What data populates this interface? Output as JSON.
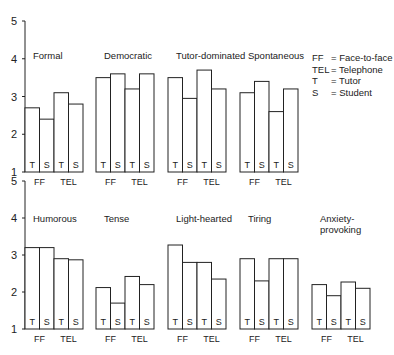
{
  "legend": [
    {
      "abbr": "FF",
      "meaning": "= Face-to-face"
    },
    {
      "abbr": "TEL",
      "meaning": "= Telephone"
    },
    {
      "abbr": "T",
      "meaning": "= Tutor"
    },
    {
      "abbr": "S",
      "meaning": "= Student"
    }
  ],
  "chart_data": {
    "type": "bar",
    "ylim": [
      1,
      5
    ],
    "yticks": [
      1,
      2,
      3,
      4,
      5
    ],
    "bar_labels": [
      "T",
      "S",
      "T",
      "S"
    ],
    "group_labels": [
      "FF",
      "TEL"
    ],
    "categories": [
      "FF-Tutor",
      "FF-Student",
      "TEL-Tutor",
      "TEL-Student"
    ],
    "panels": [
      {
        "row": 0,
        "title": [
          "Formal"
        ],
        "values": [
          2.7,
          2.4,
          3.1,
          2.8
        ]
      },
      {
        "row": 0,
        "title": [
          "Democratic"
        ],
        "values": [
          3.5,
          3.6,
          3.2,
          3.6
        ]
      },
      {
        "row": 0,
        "title": [
          "Tutor-dominated"
        ],
        "values": [
          3.5,
          2.95,
          3.7,
          3.2
        ]
      },
      {
        "row": 0,
        "title": [
          "Spontaneous"
        ],
        "values": [
          3.1,
          3.4,
          2.6,
          3.2
        ]
      },
      {
        "row": 1,
        "title": [
          "Humorous"
        ],
        "values": [
          3.2,
          3.2,
          2.9,
          2.87
        ]
      },
      {
        "row": 1,
        "title": [
          "Tense"
        ],
        "values": [
          2.12,
          1.7,
          2.42,
          2.2
        ]
      },
      {
        "row": 1,
        "title": [
          "Light-hearted"
        ],
        "values": [
          3.27,
          2.8,
          2.8,
          2.35
        ]
      },
      {
        "row": 1,
        "title": [
          "Tiring"
        ],
        "values": [
          2.9,
          2.3,
          2.9,
          2.9
        ]
      },
      {
        "row": 1,
        "title": [
          "Anxiety-",
          "provoking"
        ],
        "values": [
          2.2,
          1.9,
          2.27,
          2.1
        ]
      }
    ]
  }
}
